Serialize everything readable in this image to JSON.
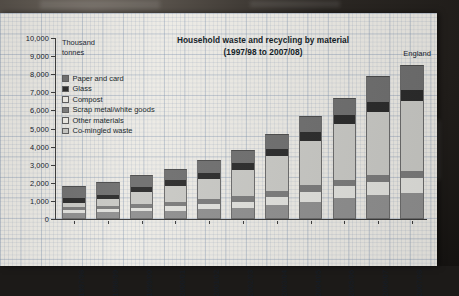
{
  "chart_data": {
    "type": "bar",
    "subtype": "stacked-bar",
    "title": "Household waste and recycling by material",
    "subtitle": "(1997/98 to 2007/08)",
    "annotation": "England",
    "ylabel": "Thousand tonnes",
    "ylabel_line1": "Thousand",
    "ylabel_line2": "tonnes",
    "xlabel": "",
    "ylim": [
      0,
      10000
    ],
    "ytick_step": 1000,
    "grid": true,
    "legend_position": "upper-left-inside",
    "ytick_labels": [
      "10,000",
      "9,000",
      "8,000",
      "7,000",
      "6,000",
      "5,000",
      "4,000",
      "3,000",
      "2,000",
      "1,000",
      "0"
    ],
    "categories": [
      "1997/98",
      "1998/99",
      "1999/00",
      "2000/01",
      "2001/02",
      "2002/03",
      "2003/04",
      "2004/05",
      "2005/06",
      "2006/07",
      "2007/08"
    ],
    "series": [
      {
        "name": "Co-mingled waste",
        "color": "#8e8e8e",
        "values": [
          330,
          360,
          420,
          470,
          530,
          600,
          780,
          950,
          1150,
          1300,
          1450
        ]
      },
      {
        "name": "Other materials",
        "color": "#e0e0dc",
        "values": [
          150,
          170,
          200,
          240,
          290,
          350,
          450,
          560,
          650,
          720,
          800
        ]
      },
      {
        "name": "Scrap metal/white goods",
        "color": "#7a7a7a",
        "values": [
          170,
          180,
          210,
          240,
          270,
          300,
          330,
          360,
          380,
          400,
          420
        ]
      },
      {
        "name": "Compost",
        "color": "#c8c8c4",
        "values": [
          250,
          400,
          650,
          900,
          1150,
          1450,
          1900,
          2450,
          3050,
          3500,
          3850
        ]
      },
      {
        "name": "Glass",
        "color": "#2a2a2a",
        "values": [
          250,
          240,
          270,
          300,
          330,
          380,
          420,
          480,
          520,
          560,
          600
        ]
      },
      {
        "name": "Paper and card",
        "color": "#6e6e6e",
        "values": [
          700,
          700,
          700,
          600,
          680,
          720,
          820,
          900,
          950,
          1420,
          1380
        ]
      }
    ],
    "totals": [
      1850,
      2050,
      2450,
      2750,
      3250,
      3800,
      4700,
      5700,
      6700,
      7900,
      8500
    ],
    "legend": [
      {
        "label": "Paper and card",
        "color": "#6e6e6e"
      },
      {
        "label": "Glass",
        "color": "#2a2a2a"
      },
      {
        "label": "Compost",
        "color": "#eceae4"
      },
      {
        "label": "Scrap metal/white goods",
        "color": "#7a7a7a"
      },
      {
        "label": "Other materials",
        "color": "#eceae4"
      },
      {
        "label": "Co-mingled waste",
        "color": "#c6c6c2"
      }
    ]
  }
}
